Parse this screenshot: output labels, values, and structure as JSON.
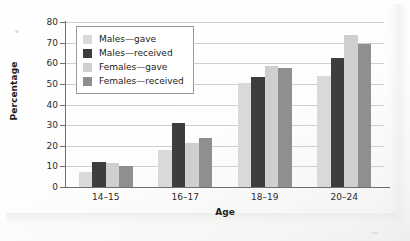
{
  "chart_data": {
    "type": "bar",
    "title": "",
    "xlabel": "Age",
    "ylabel": "Percentage",
    "ylim": [
      0,
      80
    ],
    "yticks": [
      0,
      10,
      20,
      30,
      40,
      50,
      60,
      70,
      80
    ],
    "grid": "horizontal",
    "legend_position": "upper-left-inside",
    "categories": [
      "14–15",
      "16–17",
      "18–19",
      "20–24"
    ],
    "series": [
      {
        "name": "Males—gave",
        "color": "#d9d9d9",
        "values": [
          7.5,
          18,
          50.5,
          54
        ]
      },
      {
        "name": "Males—received",
        "color": "#3d3d3d",
        "values": [
          12,
          31,
          53.5,
          62.5
        ]
      },
      {
        "name": "Females—gave",
        "color": "#cfcfcf",
        "values": [
          11.8,
          21.5,
          58.5,
          73.5
        ]
      },
      {
        "name": "Females—received",
        "color": "#8f8f8f",
        "values": [
          10,
          24,
          57.5,
          69.5
        ]
      }
    ]
  },
  "colors": {
    "axis": "#6e6e6d",
    "gridline": "#cfcfce",
    "legend_border": "#9a9a99",
    "text": "#1d1d1d",
    "page_background": "#fdfdfc"
  }
}
